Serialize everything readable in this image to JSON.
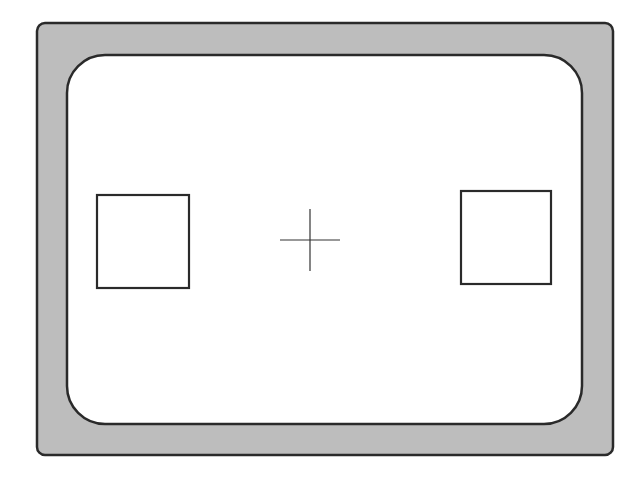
{
  "diagram": {
    "colors": {
      "background": "#ffffff",
      "frame_fill": "#bdbdbd",
      "stroke": "#2a2a2a",
      "inner_fill": "#ffffff"
    },
    "outer_frame": {
      "x": 37,
      "y": 23,
      "width": 576,
      "height": 432,
      "radius": 8
    },
    "inner_window": {
      "x": 67,
      "y": 55,
      "width": 515,
      "height": 369,
      "radius": 38
    },
    "left_box": {
      "x": 97,
      "y": 195,
      "width": 92,
      "height": 93
    },
    "right_box": {
      "x": 461,
      "y": 191,
      "width": 90,
      "height": 93
    },
    "crosshair": {
      "cx": 310,
      "cy": 240,
      "half_width": 30,
      "half_height": 31
    }
  }
}
